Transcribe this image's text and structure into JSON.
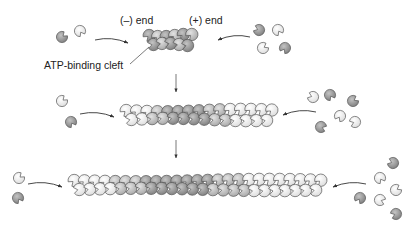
{
  "labels": {
    "minus_end": "(–) end",
    "plus_end": "(+) end",
    "atp_cleft": "ATP-binding cleft"
  },
  "colors": {
    "dark_subunit": "#8f8f8f",
    "mid_subunit": "#b8b8b8",
    "light_subunit": "#e6e6e6",
    "outline": "#555555",
    "arrow": "#333333"
  },
  "stages": [
    {
      "name": "nucleus",
      "filament": {
        "x1": 143,
        "x2": 198,
        "cy": 40,
        "subunits_per_row": 6
      },
      "monomers_left": [
        [
          62,
          37,
          "dark"
        ],
        [
          80,
          31,
          "light"
        ]
      ],
      "monomers_right": [
        [
          259,
          30,
          "dark"
        ],
        [
          278,
          30,
          "light"
        ],
        [
          263,
          48,
          "light"
        ],
        [
          285,
          48,
          "dark"
        ]
      ],
      "arrow_left": [
        95,
        40,
        128,
        43
      ],
      "arrow_right": [
        250,
        37,
        218,
        40
      ]
    },
    {
      "name": "elongating",
      "filament": {
        "x1": 120,
        "x2": 278,
        "cy": 115,
        "subunits_per_row": 15
      },
      "monomers_left": [
        [
          62,
          101,
          "light"
        ],
        [
          71,
          122,
          "dark"
        ]
      ],
      "monomers_right": [
        [
          313,
          97,
          "light"
        ],
        [
          330,
          95,
          "dark"
        ],
        [
          353,
          101,
          "dark"
        ],
        [
          340,
          116,
          "light"
        ],
        [
          321,
          127,
          "dark"
        ],
        [
          355,
          122,
          "light"
        ]
      ],
      "arrow_left": [
        80,
        114,
        114,
        117
      ],
      "arrow_right": [
        316,
        112,
        283,
        115
      ]
    },
    {
      "name": "long-filament",
      "filament": {
        "x1": 68,
        "x2": 327,
        "cy": 185,
        "subunits_per_row": 25
      },
      "monomers_left": [
        [
          19,
          178,
          "light"
        ],
        [
          18,
          198,
          "dark"
        ]
      ],
      "monomers_right": [
        [
          393,
          163,
          "dark"
        ],
        [
          380,
          178,
          "light"
        ],
        [
          396,
          190,
          "light"
        ],
        [
          360,
          198,
          "dark"
        ],
        [
          380,
          200,
          "light"
        ],
        [
          396,
          214,
          "dark"
        ]
      ],
      "arrow_left": [
        28,
        184,
        62,
        187
      ],
      "arrow_right": [
        366,
        184,
        333,
        187
      ]
    }
  ],
  "down_arrows": [
    [
      176,
      74,
      176,
      92
    ],
    [
      176,
      140,
      176,
      158
    ]
  ],
  "cleft_pointer": [
    130,
    64,
    149,
    47
  ]
}
